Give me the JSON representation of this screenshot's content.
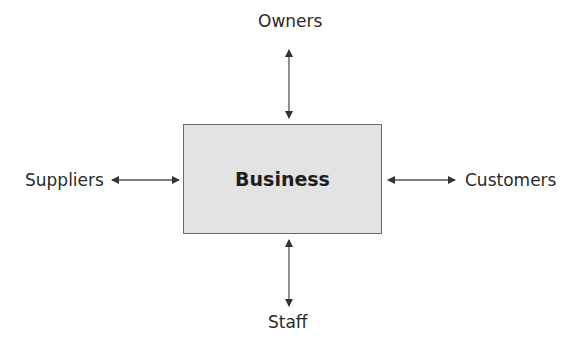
{
  "diagram": {
    "center": {
      "label": "Business",
      "fill": "#e3e3e3",
      "border": "#6a6a6a"
    },
    "nodes": {
      "top": {
        "label": "Owners"
      },
      "left": {
        "label": "Suppliers"
      },
      "right": {
        "label": "Customers"
      },
      "bottom": {
        "label": "Staff"
      }
    },
    "edges": [
      {
        "from": "Business",
        "to": "Owners",
        "type": "bidirectional"
      },
      {
        "from": "Business",
        "to": "Suppliers",
        "type": "bidirectional"
      },
      {
        "from": "Business",
        "to": "Customers",
        "type": "bidirectional"
      },
      {
        "from": "Business",
        "to": "Staff",
        "type": "bidirectional"
      }
    ],
    "arrow_color": "#333333"
  }
}
